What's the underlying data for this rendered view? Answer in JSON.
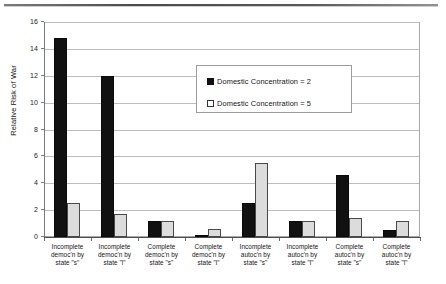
{
  "chart_data": {
    "type": "bar",
    "title": "",
    "xlabel": "",
    "ylabel": "Relative Risk of War",
    "ylim": [
      0,
      16
    ],
    "ytick_step": 2,
    "yticks": [
      "16",
      "14",
      "12",
      "10",
      "8",
      "6",
      "4",
      "2",
      "0"
    ],
    "grid": true,
    "legend_position": "upper-center-right",
    "categories": [
      "Incomplete democ'n by state \"s\"",
      "Incomplete democ'n by state \"l\"",
      "Complete democ'n by state \"s\"",
      "Complete democ'n by state \"l\"",
      "Incomplete autoc'n by state \"s\"",
      "Incomplete autoc'n by state \"l\"",
      "Complete autoc'n by state \"s\"",
      "Complete autoc'n by state \"l\""
    ],
    "category_lines": [
      [
        "Incomplete",
        "democ'n by",
        "state \"s\""
      ],
      [
        "Incomplete",
        "democ'n by",
        "state \"l\""
      ],
      [
        "Complete",
        "democ'n by",
        "state \"s\""
      ],
      [
        "Complete",
        "democ'n by",
        "state \"l\""
      ],
      [
        "Incomplete",
        "autoc'n by",
        "state \"s\""
      ],
      [
        "Incomplete",
        "autoc'n by",
        "state \"l\""
      ],
      [
        "Complete",
        "autoc'n by",
        "state \"s\""
      ],
      [
        "Complete",
        "autoc'n by",
        "state \"l\""
      ]
    ],
    "series": [
      {
        "name": "Domestic Concentration = 2",
        "color": "#111111",
        "values": [
          14.8,
          12.0,
          1.2,
          0.15,
          2.5,
          1.2,
          4.6,
          0.5
        ]
      },
      {
        "name": "Domestic Concentration = 5",
        "color": "#dcdcdc",
        "values": [
          2.5,
          1.7,
          1.2,
          0.6,
          5.5,
          1.2,
          1.4,
          1.2
        ]
      }
    ]
  },
  "legend": {
    "entries": [
      {
        "label": "Domestic Concentration = 2",
        "swatch": "filled-black"
      },
      {
        "label": "Domestic Concentration = 5",
        "swatch": "hollow-white"
      }
    ]
  },
  "axes": {
    "y_title": "Relative Risk of War"
  }
}
